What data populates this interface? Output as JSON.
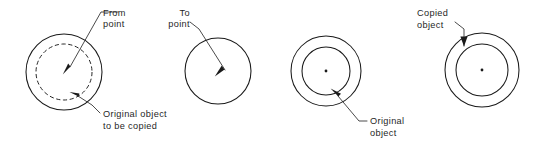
{
  "figure": {
    "background_color": "#ffffff",
    "line_color": "#1a1a1a",
    "text_color": "#1f1f1f"
  },
  "panels": [
    {
      "id": "panel-1-source",
      "name": "original-object-panel",
      "shapes": [
        {
          "kind": "circle",
          "style": "solid",
          "cx": 64,
          "cy": 72,
          "r": 38
        },
        {
          "kind": "circle",
          "style": "dashed",
          "cx": 64,
          "cy": 72,
          "r": 28
        }
      ],
      "annotations": [
        {
          "name": "from-point",
          "lines": [
            "From",
            "point"
          ],
          "text_x": 103,
          "text_y": 16,
          "align": "start",
          "target_x": 64,
          "target_y": 72
        },
        {
          "name": "original-object-to-be-copied",
          "lines": [
            "Original  object",
            "to  be  copied"
          ],
          "text_x": 103,
          "text_y": 114,
          "align": "start",
          "target_x": 77,
          "target_y": 98
        }
      ]
    },
    {
      "id": "panel-2-destination",
      "name": "to-point-panel",
      "shapes": [
        {
          "kind": "circle",
          "style": "solid",
          "cx": 218,
          "cy": 71,
          "r": 33
        }
      ],
      "annotations": [
        {
          "name": "to-point",
          "lines": [
            "To",
            "point"
          ],
          "text_x": 191,
          "text_y": 16,
          "align": "end",
          "target_x": 221,
          "target_y": 74
        }
      ]
    },
    {
      "id": "panel-3-original",
      "name": "original-object-result-panel",
      "shapes": [
        {
          "kind": "circle",
          "style": "solid",
          "cx": 326,
          "cy": 71,
          "r": 35
        },
        {
          "kind": "circle",
          "style": "solid",
          "cx": 326,
          "cy": 71,
          "r": 24
        },
        {
          "kind": "dot",
          "cx": 326,
          "cy": 71,
          "r": 1.3
        }
      ],
      "annotations": [
        {
          "name": "original-object",
          "lines": [
            "Original",
            "object"
          ],
          "text_x": 370,
          "text_y": 122,
          "align": "start",
          "target_x": 336,
          "target_y": 94
        }
      ]
    },
    {
      "id": "panel-4-copy",
      "name": "copied-object-panel",
      "shapes": [
        {
          "kind": "circle",
          "style": "solid",
          "cx": 482,
          "cy": 70,
          "r": 37
        },
        {
          "kind": "circle",
          "style": "solid",
          "cx": 482,
          "cy": 70,
          "r": 26
        },
        {
          "kind": "dot",
          "cx": 482,
          "cy": 70,
          "r": 1.3
        }
      ],
      "annotations": [
        {
          "name": "copied-object",
          "lines": [
            "Copied",
            "object"
          ],
          "text_x": 417,
          "text_y": 16,
          "align": "start",
          "target_x": 466,
          "target_y": 50
        }
      ]
    }
  ],
  "labels": {
    "from_point_l1": "From",
    "from_point_l2": "point",
    "to_point_l1": "To",
    "to_point_l2": "point",
    "original_copy_l1": "Original  object",
    "original_copy_l2": "to  be  copied",
    "original_object_l1": "Original",
    "original_object_l2": "object",
    "copied_object_l1": "Copied",
    "copied_object_l2": "object"
  }
}
